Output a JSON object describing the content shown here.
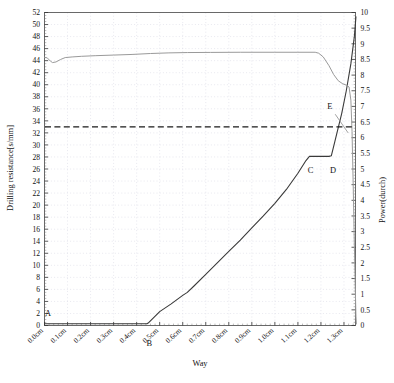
{
  "chart_data": {
    "type": "line",
    "title": "",
    "xlabel": "Way",
    "ylabel": "Drilling resistance[s/mm]",
    "y2label": "Power(durch)",
    "xlim": [
      0.0,
      1.35
    ],
    "ylim": [
      0,
      52
    ],
    "y2lim": [
      0,
      10
    ],
    "grid": true,
    "legend": "none",
    "x_ticks": [
      "0.0cm",
      "0.1cm",
      "0.2cm",
      "0.3cm",
      "0.4cm",
      "0.5cm",
      "0.6cm",
      "0.7cm",
      "0.8cm",
      "0.9cm",
      "1.0cm",
      "1.1cm",
      "1.2cm",
      "1.3cm"
    ],
    "x_tick_values": [
      0.0,
      0.1,
      0.2,
      0.3,
      0.4,
      0.5,
      0.6,
      0.7,
      0.8,
      0.9,
      1.0,
      1.1,
      1.2,
      1.3
    ],
    "y_ticks": [
      0,
      2,
      4,
      6,
      8,
      10,
      12,
      14,
      16,
      18,
      20,
      22,
      24,
      26,
      28,
      30,
      32,
      34,
      36,
      38,
      40,
      42,
      44,
      46,
      48,
      50,
      52
    ],
    "y2_ticks": [
      "0",
      "0.5",
      "1",
      "1.5",
      "2",
      "2.5",
      "3",
      "3.5",
      "4",
      "4.5",
      "5",
      "5.5",
      "6",
      "6.5",
      "7",
      "7.5",
      "8",
      "8.5",
      "9",
      "9.5",
      "10"
    ],
    "y2_tick_values": [
      0,
      0.5,
      1,
      1.5,
      2,
      2.5,
      3,
      3.5,
      4,
      4.5,
      5,
      5.5,
      6,
      6.5,
      7,
      7.5,
      8,
      8.5,
      9,
      9.5,
      10
    ],
    "series": [
      {
        "name": "drilling-resistance",
        "axis": "left",
        "color": "#3a3a3a",
        "style": "solid",
        "width": 1.1,
        "points": [
          [
            0.0,
            0.3
          ],
          [
            0.1,
            0.3
          ],
          [
            0.2,
            0.3
          ],
          [
            0.3,
            0.3
          ],
          [
            0.4,
            0.3
          ],
          [
            0.445,
            0.3
          ],
          [
            0.45,
            0.4
          ],
          [
            0.5,
            2.3
          ],
          [
            0.55,
            3.6
          ],
          [
            0.6,
            5.0
          ],
          [
            0.62,
            5.5
          ],
          [
            0.65,
            6.6
          ],
          [
            0.7,
            8.5
          ],
          [
            0.75,
            10.4
          ],
          [
            0.8,
            12.3
          ],
          [
            0.85,
            14.2
          ],
          [
            0.9,
            16.2
          ],
          [
            0.95,
            18.2
          ],
          [
            1.0,
            20.3
          ],
          [
            1.05,
            22.6
          ],
          [
            1.1,
            25.3
          ],
          [
            1.135,
            27.4
          ],
          [
            1.15,
            28.1
          ],
          [
            1.2,
            28.1
          ],
          [
            1.235,
            28.1
          ],
          [
            1.245,
            28.2
          ],
          [
            1.26,
            30.5
          ],
          [
            1.29,
            35.2
          ],
          [
            1.31,
            39.0
          ],
          [
            1.33,
            43.5
          ],
          [
            1.345,
            48.0
          ],
          [
            1.352,
            51.3
          ]
        ]
      },
      {
        "name": "power",
        "axis": "right",
        "color": "#9a9a9a",
        "style": "solid",
        "width": 1.0,
        "points": [
          [
            0.0,
            8.57
          ],
          [
            0.012,
            8.55
          ],
          [
            0.025,
            8.45
          ],
          [
            0.035,
            8.4
          ],
          [
            0.05,
            8.42
          ],
          [
            0.07,
            8.5
          ],
          [
            0.09,
            8.56
          ],
          [
            0.12,
            8.58
          ],
          [
            0.16,
            8.6
          ],
          [
            0.22,
            8.62
          ],
          [
            0.3,
            8.64
          ],
          [
            0.38,
            8.66
          ],
          [
            0.46,
            8.69
          ],
          [
            0.54,
            8.71
          ],
          [
            0.62,
            8.72
          ],
          [
            0.72,
            8.725
          ],
          [
            0.85,
            8.73
          ],
          [
            1.0,
            8.73
          ],
          [
            1.1,
            8.73
          ],
          [
            1.175,
            8.73
          ],
          [
            1.19,
            8.7
          ],
          [
            1.21,
            8.58
          ],
          [
            1.235,
            8.3
          ],
          [
            1.255,
            8.02
          ],
          [
            1.275,
            7.82
          ],
          [
            1.295,
            7.72
          ],
          [
            1.31,
            7.68
          ],
          [
            1.322,
            7.62
          ],
          [
            1.33,
            7.2
          ],
          [
            1.335,
            6.2
          ],
          [
            1.34,
            4.5
          ],
          [
            1.345,
            2.6
          ],
          [
            1.349,
            1.2
          ],
          [
            1.352,
            0.3
          ],
          [
            1.354,
            0.05
          ]
        ]
      }
    ],
    "threshold_line": {
      "name": "threshold",
      "axis": "left",
      "value": 33.0,
      "style": "dashed",
      "color": "#1a1a1a"
    },
    "annotations": [
      {
        "label": "A",
        "x": 0.015,
        "y": 1.6,
        "axis": "left"
      },
      {
        "label": "B",
        "x": 0.455,
        "y": -3.4,
        "axis": "left"
      },
      {
        "label": "C",
        "x": 1.155,
        "y": 25.3,
        "axis": "left"
      },
      {
        "label": "D",
        "x": 1.253,
        "y": 25.4,
        "axis": "left"
      },
      {
        "label": "E",
        "x": 1.238,
        "y": 36.0,
        "axis": "left"
      }
    ],
    "leader_line": {
      "from": [
        1.262,
        35.1
      ],
      "to": [
        1.318,
        32.0
      ]
    }
  },
  "caption": ""
}
